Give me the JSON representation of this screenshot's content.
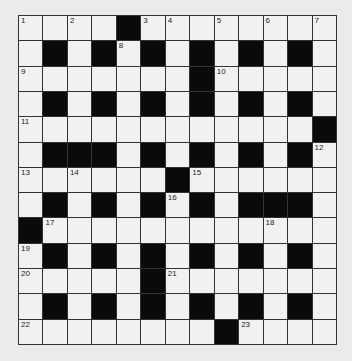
{
  "puzzle": {
    "rows": 13,
    "cols": 13,
    "colors": {
      "black": "#0a0a0a",
      "white": "#f1f1f1",
      "line": "#333333",
      "background": "#ebebeb"
    },
    "layout": [
      "....#........",
      ".#.#.#.#.#.#.",
      ".......#.....",
      ".#.#.#.#.#.#.",
      "............#",
      ".###.#.#.#.#.",
      "......#......",
      ".#.#.#.#.###.",
      "#............",
      ".#.#.#.#.#.#.",
      ".....#.......",
      ".#.#.#.#.#.#.",
      "........#...."
    ],
    "numbers": [
      {
        "r": 0,
        "c": 0,
        "n": "1"
      },
      {
        "r": 0,
        "c": 2,
        "n": "2"
      },
      {
        "r": 0,
        "c": 5,
        "n": "3"
      },
      {
        "r": 0,
        "c": 6,
        "n": "4"
      },
      {
        "r": 0,
        "c": 8,
        "n": "5"
      },
      {
        "r": 0,
        "c": 10,
        "n": "6"
      },
      {
        "r": 0,
        "c": 12,
        "n": "7"
      },
      {
        "r": 1,
        "c": 4,
        "n": "8"
      },
      {
        "r": 2,
        "c": 0,
        "n": "9"
      },
      {
        "r": 2,
        "c": 8,
        "n": "10"
      },
      {
        "r": 4,
        "c": 0,
        "n": "11"
      },
      {
        "r": 5,
        "c": 12,
        "n": "12"
      },
      {
        "r": 6,
        "c": 0,
        "n": "13"
      },
      {
        "r": 6,
        "c": 2,
        "n": "14"
      },
      {
        "r": 6,
        "c": 7,
        "n": "15"
      },
      {
        "r": 7,
        "c": 6,
        "n": "16"
      },
      {
        "r": 8,
        "c": 1,
        "n": "17"
      },
      {
        "r": 8,
        "c": 10,
        "n": "18"
      },
      {
        "r": 9,
        "c": 0,
        "n": "19"
      },
      {
        "r": 10,
        "c": 0,
        "n": "20"
      },
      {
        "r": 10,
        "c": 6,
        "n": "21"
      },
      {
        "r": 12,
        "c": 0,
        "n": "22"
      },
      {
        "r": 12,
        "c": 9,
        "n": "23"
      }
    ]
  }
}
